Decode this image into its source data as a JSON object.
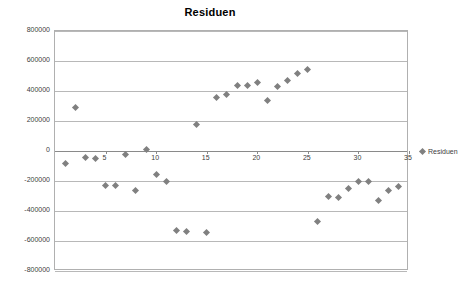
{
  "chart_data": {
    "type": "scatter",
    "title": "Residuen",
    "xlabel": "",
    "ylabel": "",
    "xlim": [
      0,
      35
    ],
    "ylim": [
      -800000,
      800000
    ],
    "xticks": [
      0,
      5,
      10,
      15,
      20,
      25,
      30,
      35
    ],
    "yticks": [
      -800000,
      -600000,
      -400000,
      -200000,
      0,
      200000,
      400000,
      600000,
      800000
    ],
    "ytick_labels": [
      "-800000",
      "-600000",
      "-400000",
      "-200000",
      "0",
      "200000",
      "400000",
      "600000",
      "800000"
    ],
    "xtick_labels": [
      "0",
      "5",
      "10",
      "15",
      "20",
      "25",
      "30",
      "35"
    ],
    "grid": true,
    "legend": [
      "Residuen"
    ],
    "legend_position": "right",
    "series": [
      {
        "name": "Residuen",
        "color": "#808080",
        "points": [
          [
            1,
            -80000
          ],
          [
            2,
            290000
          ],
          [
            3,
            -40000
          ],
          [
            4,
            -50000
          ],
          [
            5,
            -230000
          ],
          [
            6,
            -230000
          ],
          [
            7,
            -20000
          ],
          [
            8,
            -265000
          ],
          [
            9,
            10000
          ],
          [
            10,
            -155000
          ],
          [
            11,
            -205000
          ],
          [
            12,
            -530000
          ],
          [
            13,
            -535000
          ],
          [
            14,
            180000
          ],
          [
            15,
            -540000
          ],
          [
            16,
            360000
          ],
          [
            17,
            380000
          ],
          [
            18,
            440000
          ],
          [
            19,
            440000
          ],
          [
            20,
            460000
          ],
          [
            21,
            335000
          ],
          [
            22,
            430000
          ],
          [
            23,
            470000
          ],
          [
            24,
            520000
          ],
          [
            25,
            545000
          ],
          [
            26,
            -470000
          ],
          [
            27,
            -300000
          ],
          [
            28,
            -310000
          ],
          [
            29,
            -250000
          ],
          [
            30,
            -200000
          ],
          [
            31,
            -200000
          ],
          [
            32,
            -330000
          ],
          [
            33,
            -260000
          ],
          [
            34,
            -235000
          ]
        ]
      }
    ]
  }
}
